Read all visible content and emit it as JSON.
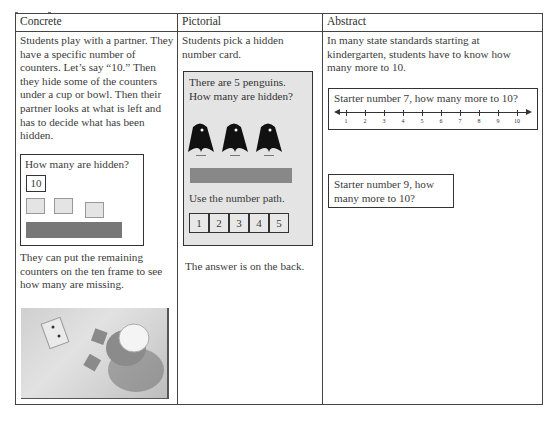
{
  "table": {
    "headers": [
      "Concrete",
      "Pictorial",
      "Abstract"
    ],
    "concrete": {
      "intro": "Students play with a partner. They have a specific number of counters. Let’s say “10.” Then they hide some of the counters under a cup or bowl. Then their partner looks at what is left and has to decide what has been hidden.",
      "card": {
        "question": "How many are hidden?",
        "number": "10",
        "counters_visible": 3
      },
      "followup": "They can put the remaining counters on the ten frame to see how many are missing.",
      "photo_alt": "photo of a number card, two counters and an upturned cup"
    },
    "pictorial": {
      "intro": "Students pick a hidden number card.",
      "card": {
        "question": "There are 5 penguins. How many are hidden?",
        "penguins_visible": 3,
        "path_label": "Use the number path.",
        "path_numbers": [
          "1",
          "2",
          "3",
          "4",
          "5"
        ]
      },
      "footer": "The answer is on the back."
    },
    "abstract": {
      "intro": "In many state standards starting at kindergarten, students have to know how many more to 10.",
      "card1": {
        "question": "Starter number 7, how many more to 10?",
        "number_line": [
          "1",
          "2",
          "3",
          "4",
          "5",
          "6",
          "7",
          "8",
          "9",
          "10"
        ]
      },
      "card2": {
        "question": "Starter number 9, how many more to 10?"
      }
    }
  }
}
